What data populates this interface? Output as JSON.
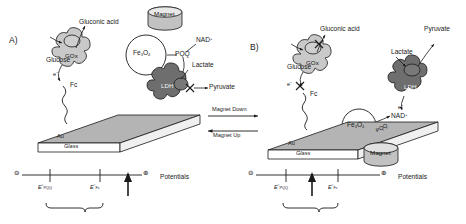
{
  "figure": {
    "caption_type": "scheme",
    "panels": [
      {
        "id": "A)",
        "state": "magnet-up",
        "enzymes": [
          {
            "name": "GOx",
            "active": true,
            "substrate": "Glucose",
            "product": "Gluconic acid"
          },
          {
            "name": "LDH",
            "active": false,
            "substrate": "Lactate",
            "product": "Pyruvate"
          }
        ],
        "mediators": [
          {
            "name": "Fc",
            "label": "Fc"
          },
          {
            "name": "PQQ",
            "label": "PQQ"
          },
          {
            "name": "NAD+",
            "label": "NAD",
            "charge": "+"
          }
        ],
        "particle": {
          "formula": "Fe",
          "sub1": "3",
          "mid": "O",
          "sub2": "4"
        },
        "magnet_label": "Magnet",
        "magnet_position": "up",
        "electrode": {
          "top_layer": "Au",
          "bottom_layer": "Glass"
        },
        "electron_label": "e",
        "electron_charge": "-",
        "axis": {
          "title": "Potentials",
          "negative_symbol": "⊖",
          "positive_symbol": "⊕",
          "ticks": [
            {
              "symbol": "E",
              "degree": "°",
              "subscript": "PQQ"
            },
            {
              "symbol": "E",
              "degree": "°",
              "subscript": "Fc"
            }
          ],
          "applied_potential_marker": "arrow-up"
        },
        "blocked_markers": 1
      },
      {
        "id": "B)",
        "state": "magnet-down",
        "enzymes": [
          {
            "name": "GOx",
            "active": false,
            "substrate": "Glucose",
            "product": "Gluconic acid"
          },
          {
            "name": "LDH",
            "active": true,
            "substrate": "Lactate",
            "product": "Pyruvate"
          }
        ],
        "mediators": [
          {
            "name": "Fc",
            "label": "Fc"
          },
          {
            "name": "PQQ",
            "label": "PQQ"
          },
          {
            "name": "NAD+",
            "label": "NAD",
            "charge": "+"
          }
        ],
        "particle": {
          "formula": "Fe",
          "sub1": "3",
          "mid": "O",
          "sub2": "4"
        },
        "magnet_label": "Magnet",
        "magnet_position": "down",
        "electrode": {
          "top_layer": "Au",
          "bottom_layer": "Glass"
        },
        "electron_label": "e",
        "electron_charge": "-",
        "axis": {
          "title": "Potentials",
          "negative_symbol": "⊖",
          "positive_symbol": "⊕",
          "ticks": [
            {
              "symbol": "E",
              "degree": "°",
              "subscript": "PQQ"
            },
            {
              "symbol": "E",
              "degree": "°",
              "subscript": "Fc"
            }
          ],
          "applied_potential_marker": "arrow-up"
        },
        "blocked_markers": 2
      }
    ],
    "switch": {
      "forward_label": "Magnet Down",
      "reverse_label": "Magnet Up"
    },
    "colors": {
      "gox_fill": "#c9c9c9",
      "ldh_fill": "#6e6e6e",
      "electrode_top": "#b4b4b4",
      "magnet_fill": "#c0c0c0",
      "stroke": "#1a1a1a",
      "background": "#ffffff"
    }
  }
}
